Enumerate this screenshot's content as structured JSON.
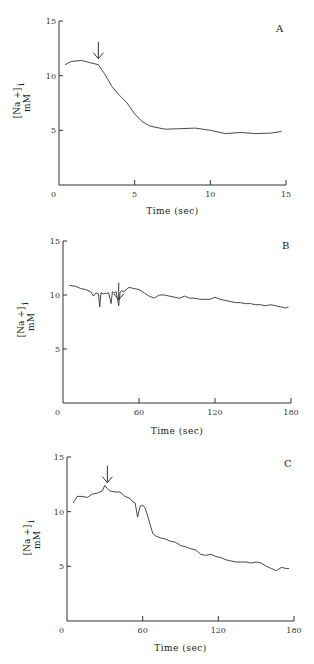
{
  "chart_data": [
    {
      "type": "line",
      "panel_label": "A",
      "xlabel": "Time (sec)",
      "ylabel": "[Na+]i mM",
      "ylabel_lines": [
        "[Na +]",
        "i",
        "mM"
      ],
      "xlim": [
        0,
        15
      ],
      "ylim": [
        0,
        15
      ],
      "xticks": [
        0,
        5,
        10,
        15
      ],
      "yticks": [
        5,
        10,
        15
      ],
      "grid": false,
      "annotation": {
        "type": "arrow",
        "x": 2.6,
        "label": "down-arrow"
      },
      "series": [
        {
          "name": "[Na+]i",
          "x": [
            0.4,
            0.8,
            1.5,
            2.0,
            2.6,
            3.0,
            3.5,
            4.0,
            4.5,
            5.0,
            5.5,
            6.0,
            7.0,
            8.0,
            9.0,
            10.0,
            11.0,
            12.0,
            13.0,
            14.0,
            14.7
          ],
          "y": [
            11.0,
            11.3,
            11.4,
            11.2,
            11.0,
            10.2,
            9.0,
            8.2,
            7.5,
            6.5,
            5.8,
            5.4,
            5.1,
            5.15,
            5.2,
            5.0,
            4.7,
            4.8,
            4.7,
            4.75,
            4.9
          ]
        }
      ]
    },
    {
      "type": "line",
      "panel_label": "B",
      "xlabel": "Time (sec)",
      "ylabel": "[Na+]i mM",
      "ylabel_lines": [
        "[Na +]",
        "i",
        "mM"
      ],
      "xlim": [
        0,
        180
      ],
      "ylim": [
        0,
        15
      ],
      "xticks": [
        0,
        60,
        120,
        180
      ],
      "yticks": [
        5,
        10,
        15
      ],
      "grid": false,
      "annotation": {
        "type": "arrow",
        "x": 44,
        "label": "down-arrow"
      },
      "series": [
        {
          "name": "[Na+]i",
          "x": [
            5,
            10,
            14,
            18,
            22,
            24,
            26,
            28,
            29,
            30,
            32,
            36,
            38,
            39,
            40,
            42,
            44,
            45,
            46,
            48,
            52,
            56,
            60,
            64,
            68,
            72,
            76,
            80,
            84,
            88,
            92,
            96,
            100,
            104,
            108,
            112,
            116,
            120,
            124,
            128,
            132,
            136,
            140,
            144,
            148,
            152,
            156,
            160,
            164,
            168,
            172,
            176,
            178
          ],
          "y": [
            10.9,
            10.8,
            10.6,
            10.5,
            10.3,
            9.9,
            10.2,
            10.1,
            8.9,
            10.2,
            10.1,
            10.2,
            9.2,
            10.3,
            10.2,
            10.3,
            9.0,
            10.2,
            10.4,
            10.3,
            10.7,
            10.6,
            10.5,
            10.2,
            9.9,
            9.7,
            10.0,
            10.0,
            9.9,
            9.8,
            9.7,
            9.9,
            9.7,
            9.7,
            9.6,
            9.6,
            9.6,
            9.8,
            9.6,
            9.5,
            9.4,
            9.3,
            9.3,
            9.2,
            9.2,
            9.1,
            9.1,
            9.0,
            9.1,
            9.0,
            8.9,
            8.8,
            8.9
          ]
        }
      ]
    },
    {
      "type": "line",
      "panel_label": "C",
      "xlabel": "Time (sec)",
      "ylabel": "[Na+]i mM",
      "ylabel_lines": [
        "[Na +]",
        "i",
        "mM"
      ],
      "xlim": [
        0,
        180
      ],
      "ylim": [
        0,
        15
      ],
      "xticks": [
        0,
        60,
        120,
        180
      ],
      "yticks": [
        5,
        10,
        15
      ],
      "grid": false,
      "annotation": {
        "type": "arrow",
        "x": 32,
        "label": "down-arrow"
      },
      "series": [
        {
          "name": "[Na+]i",
          "x": [
            5,
            8,
            12,
            16,
            20,
            24,
            28,
            30,
            32,
            34,
            38,
            42,
            46,
            50,
            52,
            54,
            56,
            58,
            60,
            62,
            64,
            66,
            68,
            70,
            74,
            78,
            82,
            86,
            90,
            94,
            98,
            102,
            106,
            110,
            114,
            118,
            122,
            126,
            130,
            134,
            138,
            142,
            146,
            150,
            154,
            158,
            162,
            166,
            170,
            174,
            176
          ],
          "y": [
            10.8,
            11.4,
            11.4,
            11.3,
            11.6,
            11.7,
            11.9,
            12.4,
            12.1,
            11.9,
            11.8,
            11.8,
            11.4,
            11.2,
            10.9,
            10.8,
            9.5,
            10.5,
            10.6,
            10.3,
            9.6,
            8.8,
            8.0,
            7.8,
            7.6,
            7.5,
            7.3,
            7.2,
            6.9,
            6.8,
            6.6,
            6.5,
            6.1,
            6.0,
            6.1,
            5.9,
            5.8,
            5.6,
            5.5,
            5.4,
            5.4,
            5.4,
            5.3,
            5.4,
            5.3,
            5.0,
            4.8,
            4.6,
            4.9,
            4.8,
            4.8
          ]
        }
      ]
    }
  ]
}
